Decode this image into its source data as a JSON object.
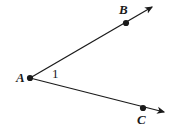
{
  "figure": {
    "type": "geometry-angle-diagram",
    "background_color": "#ffffff",
    "stroke_color": "#1a1a1a",
    "canvas": {
      "width": 174,
      "height": 136
    }
  },
  "labels": {
    "vertex_a": "A",
    "vertex_b": "B",
    "vertex_c": "C",
    "angle_1": "1"
  },
  "points": [
    {
      "name": "A",
      "label": "A",
      "x": 30,
      "y": 78,
      "role": "vertex"
    },
    {
      "name": "B",
      "label": "B",
      "x": 126,
      "y": 23,
      "role": "ray-point"
    },
    {
      "name": "C",
      "label": "C",
      "x": 143,
      "y": 108,
      "role": "ray-point"
    }
  ],
  "rays": [
    {
      "name": "ray-ab",
      "from": "A",
      "through": "B",
      "start": {
        "x": 30,
        "y": 78
      },
      "end": {
        "x": 152,
        "y": 7
      },
      "arrowhead": true
    },
    {
      "name": "ray-ac",
      "from": "A",
      "through": "C",
      "start": {
        "x": 30,
        "y": 78
      },
      "end": {
        "x": 164,
        "y": 112
      },
      "arrowhead": true
    }
  ]
}
